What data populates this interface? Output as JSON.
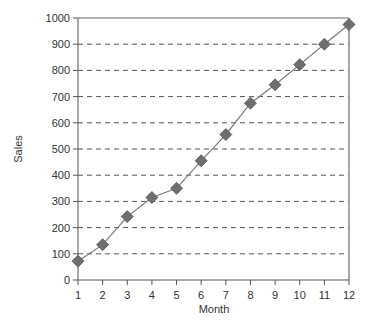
{
  "chart_data": {
    "type": "line",
    "title": "",
    "xlabel": "Month",
    "ylabel": "Sales",
    "x": [
      1,
      2,
      3,
      4,
      5,
      6,
      7,
      8,
      9,
      10,
      11,
      12
    ],
    "categories": [
      "1",
      "2",
      "3",
      "4",
      "5",
      "6",
      "7",
      "8",
      "9",
      "10",
      "11",
      "12"
    ],
    "series": [
      {
        "name": "Sales",
        "values": [
          72,
          135,
          242,
          315,
          350,
          455,
          555,
          675,
          745,
          822,
          900,
          975
        ],
        "marker": "diamond",
        "line_color": "#7a7a7a",
        "marker_color": "#6e6e6e"
      }
    ],
    "xlim": [
      1,
      12
    ],
    "ylim": [
      0,
      1000
    ],
    "yticks": [
      0,
      100,
      200,
      300,
      400,
      500,
      600,
      700,
      800,
      900,
      1000
    ],
    "xticks": [
      1,
      2,
      3,
      4,
      5,
      6,
      7,
      8,
      9,
      10,
      11,
      12
    ],
    "grid": "horizontal dashed",
    "legend": "none"
  }
}
